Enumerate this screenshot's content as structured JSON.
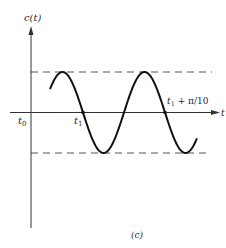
{
  "figure": {
    "caption": "(c)",
    "y_axis_label": "c(t)",
    "x_axis_label": "t",
    "origin_label": "t",
    "origin_sub": "0",
    "t1_label": "t",
    "t1_sub": "1",
    "t2_label_main": "t",
    "t2_label_sub": "1",
    "t2_label_rest": " + π/10"
  },
  "colors": {
    "curve": "#111111",
    "axis": "#333333",
    "dashed": "#555555",
    "text": "#2a2a2a"
  },
  "diagram": {
    "type": "sinusoid-plot",
    "axes": {
      "x_axis_y": 112.5,
      "y_axis_x": 31
    },
    "amplitude_lines": {
      "upper_y": 72,
      "lower_y": 153
    },
    "curve": {
      "start_x": 50,
      "end_x": 197,
      "center_y": 112.5,
      "amplitude": 40.5,
      "period_px": 82,
      "zero_crossing_x": 83
    }
  }
}
